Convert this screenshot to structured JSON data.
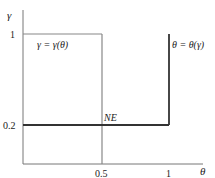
{
  "diagram": {
    "axes": {
      "y_label": "γ",
      "x_label": "θ",
      "y_ticks": [
        {
          "label": "1",
          "value": 1
        },
        {
          "label": "0.2",
          "value": 0.2
        }
      ],
      "x_ticks": [
        {
          "label": "0.5",
          "value": 0.5
        },
        {
          "label": "1",
          "value": 1
        }
      ]
    },
    "curves": {
      "gamma_label": "γ = γ(θ)",
      "theta_label": "θ = θ(γ)"
    },
    "equilibrium_label": "NE",
    "colors": {
      "axis": "#777777",
      "gamma_curve": "#888888",
      "theta_curve": "#333333",
      "text": "#222222"
    }
  }
}
